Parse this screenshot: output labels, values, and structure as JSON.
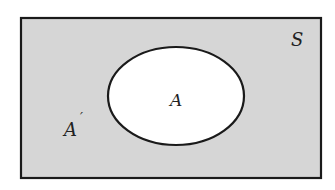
{
  "diagram": {
    "type": "venn",
    "universe": {
      "label": "S",
      "fill": "#d6d6d6",
      "stroke": "#1a1a1a",
      "x": 21,
      "y": 18,
      "width": 300,
      "height": 160
    },
    "set": {
      "label": "A",
      "fill": "#ffffff",
      "stroke": "#1a1a1a",
      "cx": 176,
      "cy": 96,
      "rx": 68,
      "ry": 49
    },
    "complement": {
      "label": "A",
      "prime": "′"
    }
  }
}
